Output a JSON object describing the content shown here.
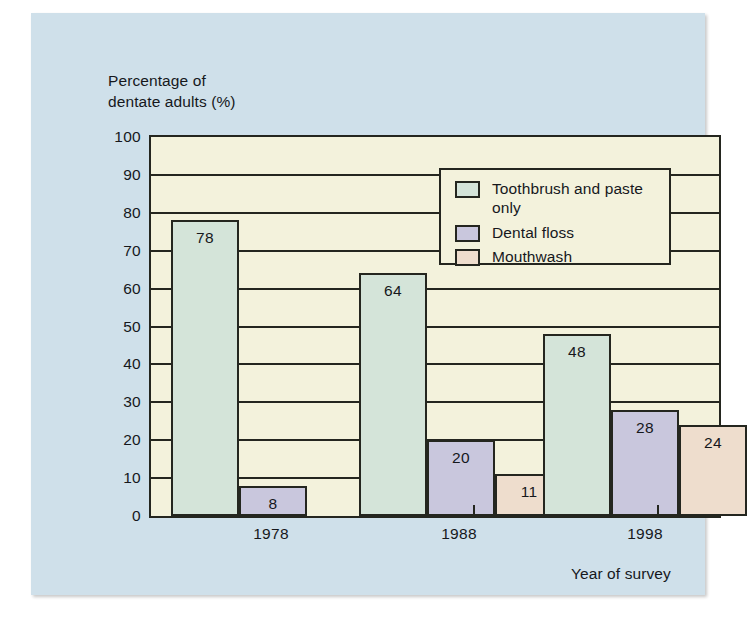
{
  "chart_data": {
    "type": "bar",
    "title": "",
    "xlabel": "Year of survey",
    "ylabel": "Percentage of\ndentate adults (%)",
    "categories": [
      "1978",
      "1988",
      "1998"
    ],
    "ylim": [
      0,
      100
    ],
    "yticks": [
      "0",
      "10",
      "20",
      "30",
      "40",
      "50",
      "60",
      "70",
      "80",
      "90",
      "100"
    ],
    "grid": true,
    "legend_position": "upper-right",
    "series": [
      {
        "name": "Toothbrush and paste\nonly",
        "color": "#d4e4d9",
        "values": [
          78,
          64,
          48
        ]
      },
      {
        "name": "Dental floss",
        "color": "#c9c7dd",
        "values": [
          8,
          20,
          28
        ]
      },
      {
        "name": "Mouthwash",
        "color": "#eeddcd",
        "values": [
          null,
          11,
          24
        ]
      }
    ]
  },
  "style": {
    "panel_background": "#cfe0ea",
    "plot_background": "#f3f2dc",
    "line_color": "#24261f",
    "text_color": "#16181c"
  }
}
